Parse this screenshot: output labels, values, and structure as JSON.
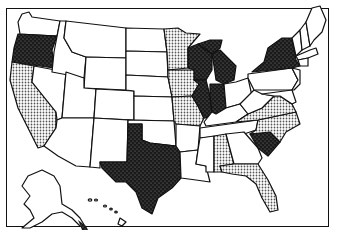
{
  "map": {
    "title": "",
    "projection": "US states choropleth (scanned, black and white)",
    "legend": {
      "classes": [
        {
          "id": "dark",
          "pattern": "dense black stipple",
          "color": "#1a1a1a"
        },
        {
          "id": "light",
          "pattern": "gray dot screen",
          "color": "#b8b8b8"
        },
        {
          "id": "none",
          "pattern": "blank",
          "color": "#ffffff"
        }
      ]
    },
    "states": {
      "dark": [
        "Oregon",
        "Texas",
        "Wisconsin",
        "Illinois",
        "Michigan",
        "Indiana",
        "New York",
        "South Carolina"
      ],
      "light": [
        "California",
        "Minnesota",
        "Iowa",
        "Missouri",
        "Virginia",
        "North Carolina",
        "Alabama",
        "Florida"
      ],
      "none": [
        "Washington",
        "Idaho",
        "Montana",
        "Wyoming",
        "Nevada",
        "Utah",
        "Colorado",
        "Arizona",
        "New Mexico",
        "North Dakota",
        "South Dakota",
        "Nebraska",
        "Kansas",
        "Oklahoma",
        "Arkansas",
        "Louisiana",
        "Mississippi",
        "Tennessee",
        "Kentucky",
        "Ohio",
        "Georgia",
        "West Virginia",
        "Pennsylvania",
        "Maine",
        "Vermont",
        "New Hampshire",
        "Massachusetts",
        "Connecticut",
        "New Jersey",
        "Alaska",
        "Hawaii"
      ]
    }
  }
}
